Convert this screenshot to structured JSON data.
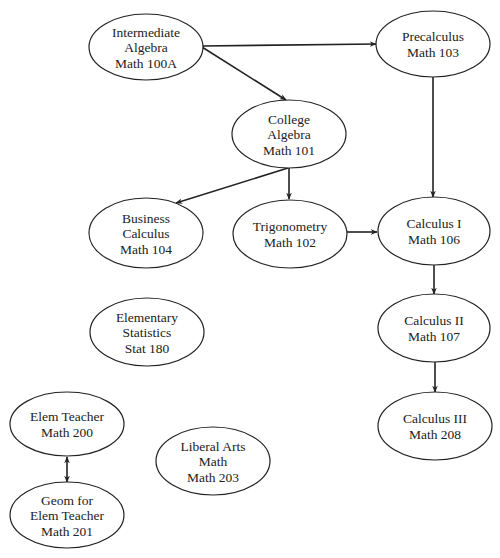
{
  "diagram": {
    "type": "course-prerequisite-flowchart",
    "colors": {
      "background": "#ffffff",
      "stroke": "#222222",
      "text": "#222222"
    },
    "nodes": [
      {
        "id": "math100a",
        "lines": [
          "Intermediate",
          "Algebra",
          "Math 100A"
        ],
        "cx": 146,
        "cy": 47,
        "rx": 57,
        "ry": 33
      },
      {
        "id": "math103",
        "lines": [
          "Precalculus",
          "Math 103"
        ],
        "cx": 433,
        "cy": 44,
        "rx": 57,
        "ry": 33
      },
      {
        "id": "math101",
        "lines": [
          "College",
          "Algebra",
          "Math 101"
        ],
        "cx": 289,
        "cy": 134,
        "rx": 57,
        "ry": 34
      },
      {
        "id": "math104",
        "lines": [
          "Business",
          "Calculus",
          "Math 104"
        ],
        "cx": 146,
        "cy": 233,
        "rx": 57,
        "ry": 35
      },
      {
        "id": "math102",
        "lines": [
          "Trigonometry",
          "Math 102"
        ],
        "cx": 290,
        "cy": 234,
        "rx": 57,
        "ry": 34
      },
      {
        "id": "math106",
        "lines": [
          "Calculus I",
          "Math 106"
        ],
        "cx": 434,
        "cy": 231,
        "rx": 56,
        "ry": 34
      },
      {
        "id": "stat180",
        "lines": [
          "Elementary",
          "Statistics",
          "Stat 180"
        ],
        "cx": 147,
        "cy": 332,
        "rx": 57,
        "ry": 34
      },
      {
        "id": "math107",
        "lines": [
          "Calculus II",
          "Math 107"
        ],
        "cx": 434,
        "cy": 328,
        "rx": 56,
        "ry": 34
      },
      {
        "id": "math208",
        "lines": [
          "Calculus III",
          "Math 208"
        ],
        "cx": 435,
        "cy": 426,
        "rx": 57,
        "ry": 34
      },
      {
        "id": "math200",
        "lines": [
          "Elem Teacher",
          "Math 200"
        ],
        "cx": 67,
        "cy": 424,
        "rx": 57,
        "ry": 32
      },
      {
        "id": "math203",
        "lines": [
          "Liberal Arts",
          "Math",
          "Math 203"
        ],
        "cx": 213,
        "cy": 461,
        "rx": 57,
        "ry": 34
      },
      {
        "id": "math201",
        "lines": [
          "Geom for",
          "Elem Teacher",
          "Math 201"
        ],
        "cx": 67,
        "cy": 515,
        "rx": 57,
        "ry": 33
      }
    ],
    "edges": [
      {
        "from": "math100a",
        "to": "math103",
        "x1": 202,
        "y1": 46,
        "x2": 376,
        "y2": 44,
        "bidirectional": false
      },
      {
        "from": "math100a",
        "to": "math101",
        "x1": 202,
        "y1": 47,
        "x2": 286,
        "y2": 100,
        "bidirectional": false
      },
      {
        "from": "math103",
        "to": "math106",
        "x1": 433,
        "y1": 77,
        "x2": 433,
        "y2": 197,
        "bidirectional": false
      },
      {
        "from": "math101",
        "to": "math104",
        "x1": 288,
        "y1": 168,
        "x2": 176,
        "y2": 203,
        "bidirectional": false
      },
      {
        "from": "math101",
        "to": "math102",
        "x1": 289,
        "y1": 168,
        "x2": 289,
        "y2": 199,
        "bidirectional": false
      },
      {
        "from": "math102",
        "to": "math106",
        "x1": 347,
        "y1": 232,
        "x2": 377,
        "y2": 232,
        "bidirectional": false
      },
      {
        "from": "math106",
        "to": "math107",
        "x1": 434,
        "y1": 265,
        "x2": 434,
        "y2": 294,
        "bidirectional": false
      },
      {
        "from": "math107",
        "to": "math208",
        "x1": 435,
        "y1": 362,
        "x2": 435,
        "y2": 392,
        "bidirectional": false
      },
      {
        "from": "math200",
        "to": "math201",
        "x1": 67,
        "y1": 457,
        "x2": 67,
        "y2": 482,
        "bidirectional": true
      }
    ]
  }
}
